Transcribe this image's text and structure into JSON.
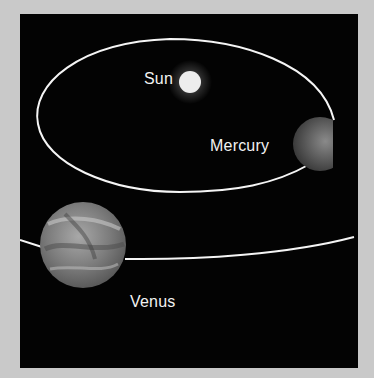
{
  "diagram": {
    "title": "",
    "background_color": "#c9c9c9",
    "panel_color": "#030303",
    "orbit_color": "#f5f5f5",
    "bodies": [
      {
        "id": "sun",
        "label": "Sun"
      },
      {
        "id": "mercury",
        "label": "Mercury"
      },
      {
        "id": "venus",
        "label": "Venus"
      }
    ]
  }
}
